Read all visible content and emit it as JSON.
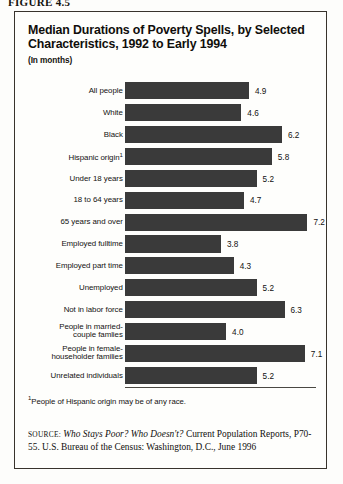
{
  "figure_tag": "FIGURE 4.5",
  "title": {
    "line1": "Median Durations of Poverty Spells, by Selected",
    "line2": "Characteristics, 1992 to Early 1994",
    "subtitle": "(In months)"
  },
  "footnote": {
    "marker": "1",
    "text": "People of Hispanic origin may be of any race."
  },
  "source": {
    "label": "source:",
    "title": "Who Stays Poor? Who Doesn't?",
    "rest": " Current Population Reports, P70-55. U.S. Bureau of the Census: Washington, D.C., June 1996"
  },
  "chart_data": {
    "type": "bar",
    "orientation": "horizontal",
    "title": "Median Durations of Poverty Spells, by Selected Characteristics, 1992 to Early 1994",
    "xlabel": "",
    "ylabel": "",
    "unit": "months",
    "grid": false,
    "legend": "none",
    "bar_color": "#3a3a3a",
    "xlim": [
      0,
      7.6
    ],
    "categories": [
      "All people",
      "White",
      "Black",
      "Hispanic origin¹",
      "Under 18 years",
      "18 to 64 years",
      "65 years and over",
      "Employed fulltime",
      "Employed part time",
      "Unemployed",
      "Not in labor force",
      "People in married-\ncouple famlies",
      "People in female-\nhouseholder families",
      "Unrelated individuals"
    ],
    "values": [
      4.9,
      4.6,
      6.2,
      5.8,
      5.2,
      4.7,
      7.2,
      3.8,
      4.3,
      5.2,
      6.3,
      4.0,
      7.1,
      5.2
    ],
    "value_labels": [
      "4.9",
      "4.6",
      "6.2",
      "5.8",
      "5.2",
      "4.7",
      "7.2",
      "3.8",
      "4.3",
      "5.2",
      "6.3",
      "4.0",
      "7.1",
      "5.2"
    ]
  }
}
